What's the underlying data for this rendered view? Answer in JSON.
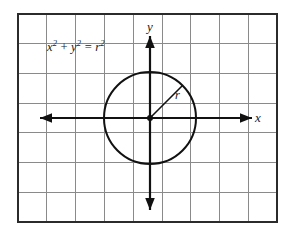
{
  "figure": {
    "type": "coordinate-grid-circle-diagram",
    "background_color": "#ffffff",
    "frame": {
      "color": "#2b2b2b",
      "x": 18,
      "y": 14,
      "width": 259,
      "height": 208,
      "stroke_width": 2
    },
    "grid": {
      "color": "#8a8a8a",
      "stroke_width": 1,
      "columns": 9,
      "rows": 7,
      "cell_width": 28.8,
      "cell_height": 29.7,
      "vertical_lines_x": [
        46.8,
        75.6,
        104.4,
        133.2,
        162.0,
        190.8,
        219.6,
        248.4
      ],
      "horizontal_lines_y": [
        43.7,
        73.4,
        103.1,
        132.8,
        162.5,
        192.2
      ]
    },
    "axes": {
      "color": "#111111",
      "stroke_width": 2.2,
      "origin": {
        "x": 150,
        "y": 118
      },
      "x_axis": {
        "start_x": 40,
        "end_x": 252,
        "y": 118,
        "arrows": "both"
      },
      "y_axis": {
        "x": 150,
        "start_y": 36,
        "end_y": 210,
        "arrows": "both"
      },
      "x_label": "x",
      "y_label": "y"
    },
    "circle": {
      "color": "#111111",
      "stroke_width": 2,
      "center_x": 150,
      "center_y": 118,
      "radius": 46,
      "fill": "none"
    },
    "center_point": {
      "color": "#111111",
      "radius": 3
    },
    "radius_line": {
      "color": "#111111",
      "stroke_width": 1.6,
      "from_x": 150,
      "from_y": 118,
      "to_x": 182.5,
      "to_y": 85.5
    },
    "radius_label": "r",
    "equation": {
      "x_term": "x",
      "x_exponent": "2",
      "plus": " + ",
      "y_term": "y",
      "y_exponent": "2",
      "equals": " = ",
      "r_term": "r",
      "r_exponent": "2",
      "full_text": "x² + y² = r²"
    }
  }
}
